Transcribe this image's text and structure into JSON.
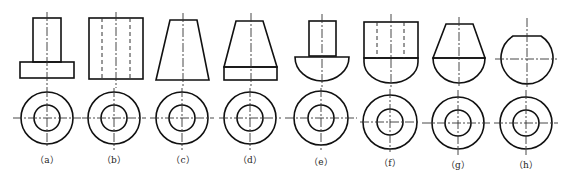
{
  "figure": {
    "labels": [
      "（a）",
      "（b）",
      "（c）",
      "（d）",
      "（e）",
      "（f）",
      "（g）",
      "（h）"
    ],
    "colors": {
      "line": "#111111",
      "background": "#ffffff"
    }
  }
}
